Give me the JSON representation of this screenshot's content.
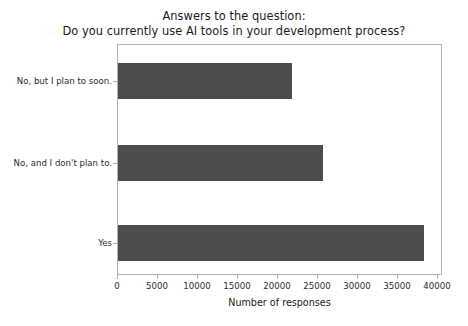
{
  "chart_data": {
    "type": "bar",
    "orientation": "horizontal",
    "title": "Answers to the question:\nDo you currently use AI tools in your development process?",
    "title_lines": [
      "Answers to the question:",
      "Do you currently use AI tools in your development process?"
    ],
    "categories": [
      "No, but I plan to soon.",
      "No, and I don't plan to.",
      "Yes"
    ],
    "values": [
      21800,
      25600,
      38300
    ],
    "xlabel": "Number of responses",
    "ylabel": "",
    "xlim": [
      0,
      40000
    ],
    "xticks": [
      0,
      5000,
      10000,
      15000,
      20000,
      25000,
      30000,
      35000,
      40000
    ],
    "xtick_labels": [
      "0",
      "5000",
      "10000",
      "15000",
      "20000",
      "25000",
      "30000",
      "35000",
      "40000"
    ],
    "grid": false,
    "legend": null,
    "bar_color": "#4d4d4d",
    "background_color": "#ffffff",
    "axes_edge_color": "#b0b0b0"
  }
}
